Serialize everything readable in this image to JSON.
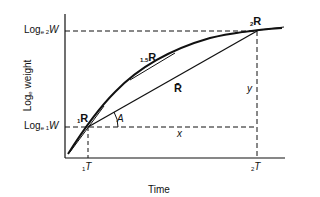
{
  "diagram": {
    "type": "growth-curve",
    "axes": {
      "x_label": "Time",
      "y_label_main": "Log",
      "y_label_sub": "e",
      "y_label_rest": " weight"
    },
    "y_ticks": [
      {
        "prefix": "Log",
        "sub": "e 2",
        "var": "W"
      },
      {
        "prefix": "Log",
        "sub": "e 1",
        "var": "W"
      }
    ],
    "x_ticks": [
      {
        "sub": "1",
        "var": "T"
      },
      {
        "sub": "2",
        "var": "T"
      }
    ],
    "points": [
      {
        "sub": "1",
        "name": "R"
      },
      {
        "sub": "1.5",
        "name": "R"
      },
      {
        "sub": "2",
        "name": "R"
      }
    ],
    "chord_label": "R̄",
    "angle_label": "A",
    "dx_label": "x",
    "dy_label": "y",
    "colors": {
      "ink": "#111111",
      "background": "#ffffff"
    }
  }
}
